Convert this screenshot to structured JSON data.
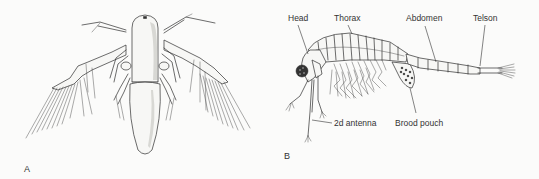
{
  "figure": {
    "panels": [
      {
        "id": "A",
        "label": "A",
        "subject": "nauplius larva, dorsal view"
      },
      {
        "id": "B",
        "label": "B",
        "subject": "adult brine shrimp, lateral view",
        "annotations": [
          {
            "key": "head",
            "text": "Head"
          },
          {
            "key": "thorax",
            "text": "Thorax"
          },
          {
            "key": "abdomen",
            "text": "Abdomen"
          },
          {
            "key": "telson",
            "text": "Telson"
          },
          {
            "key": "second_antenna",
            "text": "2d antenna"
          },
          {
            "key": "brood_pouch",
            "text": "Brood pouch"
          }
        ]
      }
    ]
  },
  "colors": {
    "background": "#fbfbfa",
    "ink": "#2e2e2e"
  }
}
